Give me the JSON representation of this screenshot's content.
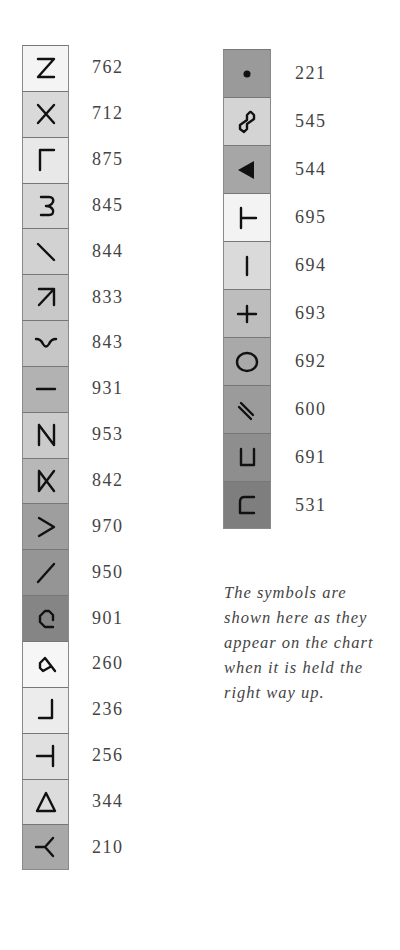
{
  "left_column": [
    {
      "symbol": "Z-icon",
      "code": "762",
      "shade": "#f4f4f4"
    },
    {
      "symbol": "X-icon",
      "code": "712",
      "shade": "#d9d9d9"
    },
    {
      "symbol": "L-icon",
      "code": "875",
      "shade": "#e8e8e8"
    },
    {
      "symbol": "omega-rotated-icon",
      "code": "845",
      "shade": "#d6d6d6"
    },
    {
      "symbol": "backslash-icon",
      "code": "844",
      "shade": "#d2d2d2"
    },
    {
      "symbol": "arrow-up-right-icon",
      "code": "833",
      "shade": "#c8c8c8"
    },
    {
      "symbol": "tilde-curve-icon",
      "code": "843",
      "shade": "#c6c6c6"
    },
    {
      "symbol": "dash-icon",
      "code": "931",
      "shade": "#b2b2b2"
    },
    {
      "symbol": "N-icon",
      "code": "953",
      "shade": "#cbcbcb"
    },
    {
      "symbol": "bowtie-icon",
      "code": "842",
      "shade": "#b8b8b8"
    },
    {
      "symbol": "greater-than-icon",
      "code": "970",
      "shade": "#9e9e9e"
    },
    {
      "symbol": "slash-icon",
      "code": "950",
      "shade": "#959595"
    },
    {
      "symbol": "octagon-c-icon",
      "code": "901",
      "shade": "#858585"
    },
    {
      "symbol": "loop-6-icon",
      "code": "260",
      "shade": "#f6f6f6"
    },
    {
      "symbol": "reverse-L-icon",
      "code": "236",
      "shade": "#ececec"
    },
    {
      "symbol": "left-tack-icon",
      "code": "256",
      "shade": "#e0e0e0"
    },
    {
      "symbol": "triangle-outline-icon",
      "code": "344",
      "shade": "#dcdcdc"
    },
    {
      "symbol": "Y-rotated-icon",
      "code": "210",
      "shade": "#a8a8a8"
    }
  ],
  "right_column": [
    {
      "symbol": "dot-icon",
      "code": "221",
      "shade": "#9a9a9a"
    },
    {
      "symbol": "octagon-S-icon",
      "code": "545",
      "shade": "#d4d4d4"
    },
    {
      "symbol": "filled-triangle-left-icon",
      "code": "544",
      "shade": "#a6a6a6"
    },
    {
      "symbol": "T-rotated-icon",
      "code": "695",
      "shade": "#f3f3f3"
    },
    {
      "symbol": "vertical-bar-icon",
      "code": "694",
      "shade": "#dadada"
    },
    {
      "symbol": "plus-icon",
      "code": "693",
      "shade": "#bdbdbd"
    },
    {
      "symbol": "circle-outline-icon",
      "code": "692",
      "shade": "#a9a9a9"
    },
    {
      "symbol": "double-slash-icon",
      "code": "600",
      "shade": "#9b9b9b"
    },
    {
      "symbol": "U-square-icon",
      "code": "691",
      "shade": "#8e8e8e"
    },
    {
      "symbol": "C-square-icon",
      "code": "531",
      "shade": "#7e7e7e"
    }
  ],
  "note": "The symbols are shown here as they appear on the chart when it is held the right way up."
}
